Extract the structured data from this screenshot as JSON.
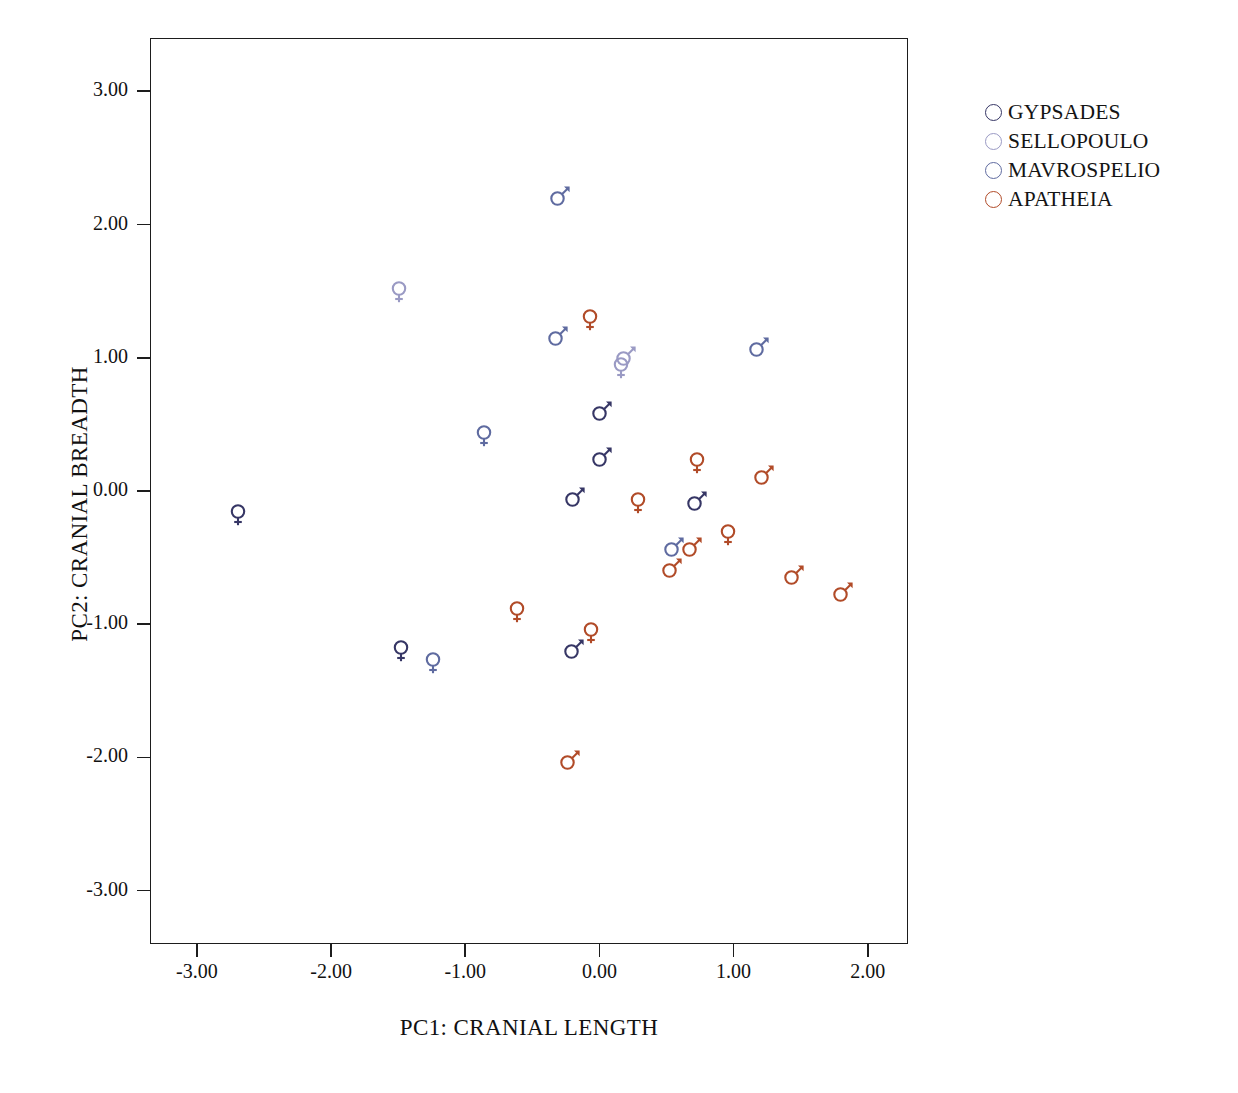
{
  "chart_data": {
    "type": "scatter",
    "title": "",
    "xlabel": "PC1: CRANIAL LENGTH",
    "ylabel": "PC2: CRANIAL BREADTH",
    "xlim": [
      -3.35,
      2.3
    ],
    "ylim": [
      -3.4,
      3.4
    ],
    "xticks": [
      "-3.00",
      "-2.00",
      "-1.00",
      "0.00",
      "1.00",
      "2.00"
    ],
    "xtickvals": [
      -3,
      -2,
      -1,
      0,
      1,
      2
    ],
    "yticks": [
      "3.00",
      "2.00",
      "1.00",
      "0.00",
      "-1.00",
      "-2.00",
      "-3.00"
    ],
    "ytickvals": [
      3,
      2,
      1,
      0,
      -1,
      -2,
      -3
    ],
    "grid": false,
    "legend_position": "right",
    "series": [
      {
        "name": "GYPSADES",
        "color": "#363665",
        "points": [
          {
            "x": -2.7,
            "y": -0.17,
            "sex": "female"
          },
          {
            "x": -1.49,
            "y": -1.19,
            "sex": "female"
          },
          {
            "x": -0.2,
            "y": -1.18,
            "sex": "male"
          },
          {
            "x": 0.01,
            "y": 0.61,
            "sex": "male"
          },
          {
            "x": 0.01,
            "y": 0.26,
            "sex": "male"
          },
          {
            "x": -0.19,
            "y": -0.04,
            "sex": "male"
          },
          {
            "x": 0.72,
            "y": -0.07,
            "sex": "male"
          }
        ]
      },
      {
        "name": "SELLOPOULO",
        "color": "#9a9ac4",
        "points": [
          {
            "x": -1.5,
            "y": 1.5,
            "sex": "female"
          },
          {
            "x": 0.15,
            "y": 0.93,
            "sex": "female"
          },
          {
            "x": 0.19,
            "y": 1.02,
            "sex": "male"
          }
        ]
      },
      {
        "name": "MAVROSPELIO",
        "color": "#5f6ba0",
        "points": [
          {
            "x": -0.3,
            "y": 2.22,
            "sex": "male"
          },
          {
            "x": -0.32,
            "y": 1.17,
            "sex": "male"
          },
          {
            "x": 1.18,
            "y": 1.09,
            "sex": "male"
          },
          {
            "x": -0.87,
            "y": 0.42,
            "sex": "female"
          },
          {
            "x": -1.25,
            "y": -1.28,
            "sex": "female"
          },
          {
            "x": 0.55,
            "y": -0.41,
            "sex": "male"
          }
        ]
      },
      {
        "name": "APATHEIA",
        "color": "#b14b28",
        "points": [
          {
            "x": -0.08,
            "y": 1.29,
            "sex": "female"
          },
          {
            "x": 0.72,
            "y": 0.22,
            "sex": "female"
          },
          {
            "x": 1.22,
            "y": 0.13,
            "sex": "male"
          },
          {
            "x": 0.28,
            "y": -0.08,
            "sex": "female"
          },
          {
            "x": 0.95,
            "y": -0.32,
            "sex": "female"
          },
          {
            "x": 0.68,
            "y": -0.41,
            "sex": "male"
          },
          {
            "x": 0.53,
            "y": -0.57,
            "sex": "male"
          },
          {
            "x": 1.44,
            "y": -0.62,
            "sex": "male"
          },
          {
            "x": 1.81,
            "y": -0.75,
            "sex": "male"
          },
          {
            "x": -0.62,
            "y": -0.9,
            "sex": "female"
          },
          {
            "x": -0.07,
            "y": -1.06,
            "sex": "female"
          },
          {
            "x": -0.23,
            "y": -2.01,
            "sex": "male"
          }
        ]
      }
    ]
  },
  "legend": {
    "items": [
      {
        "label": "GYPSADES",
        "color": "#363665"
      },
      {
        "label": "SELLOPOULO",
        "color": "#9a9ac4"
      },
      {
        "label": "MAVROSPELIO",
        "color": "#5f6ba0"
      },
      {
        "label": "APATHEIA",
        "color": "#b14b28"
      }
    ]
  }
}
